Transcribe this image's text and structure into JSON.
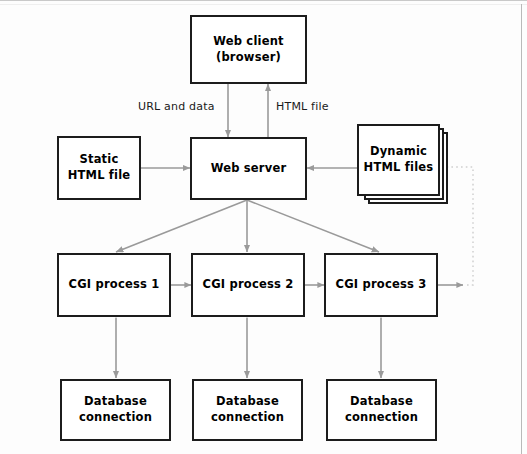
{
  "diagram": {
    "colors": {
      "node_border": "#1c1c1c",
      "node_fill": "#ffffff",
      "arrow": "#9a9a9a",
      "dotted_arrow": "#cfcfcf",
      "text": "#000000",
      "frame": "#c9c9c9"
    },
    "nodes": [
      {
        "id": "web-client",
        "line1": "Web client",
        "line2": "(browser)"
      },
      {
        "id": "static-html",
        "line1": "Static",
        "line2": "HTML file"
      },
      {
        "id": "web-server",
        "line1": "Web server",
        "line2": ""
      },
      {
        "id": "dynamic-html",
        "line1": "Dynamic",
        "line2": "HTML files"
      },
      {
        "id": "cgi-1",
        "line1": "CGI process 1",
        "line2": ""
      },
      {
        "id": "cgi-2",
        "line1": "CGI process 2",
        "line2": ""
      },
      {
        "id": "cgi-3",
        "line1": "CGI process 3",
        "line2": ""
      },
      {
        "id": "db-1",
        "line1": "Database",
        "line2": "connection"
      },
      {
        "id": "db-2",
        "line1": "Database",
        "line2": "connection"
      },
      {
        "id": "db-3",
        "line1": "Database",
        "line2": "connection"
      }
    ],
    "edge_labels": [
      {
        "id": "url-and-data",
        "text": "URL and data"
      },
      {
        "id": "html-file",
        "text": "HTML file"
      }
    ],
    "edges": [
      {
        "from": "web-client",
        "to": "web-server",
        "label": "URL and data",
        "style": "solid",
        "heads": 1
      },
      {
        "from": "web-server",
        "to": "web-client",
        "label": "HTML file",
        "style": "solid",
        "heads": 1
      },
      {
        "from": "static-html",
        "to": "web-server",
        "label": "",
        "style": "solid",
        "heads": 1
      },
      {
        "from": "dynamic-html",
        "to": "web-server",
        "label": "",
        "style": "solid",
        "heads": 1
      },
      {
        "from": "web-server",
        "to": "cgi-1",
        "label": "",
        "style": "solid",
        "heads": 1
      },
      {
        "from": "web-server",
        "to": "cgi-2",
        "label": "",
        "style": "solid",
        "heads": 1
      },
      {
        "from": "web-server",
        "to": "cgi-3",
        "label": "",
        "style": "solid",
        "heads": 1
      },
      {
        "from": "cgi-1",
        "to": "cgi-2",
        "label": "",
        "style": "solid",
        "heads": 1
      },
      {
        "from": "cgi-2",
        "to": "cgi-3",
        "label": "",
        "style": "solid",
        "heads": 1
      },
      {
        "from": "cgi-3",
        "to": "dynamic-html",
        "label": "",
        "style": "dotted",
        "heads": 1
      },
      {
        "from": "cgi-1",
        "to": "db-1",
        "label": "",
        "style": "solid",
        "heads": 2
      },
      {
        "from": "cgi-2",
        "to": "db-2",
        "label": "",
        "style": "solid",
        "heads": 2
      },
      {
        "from": "cgi-3",
        "to": "db-3",
        "label": "",
        "style": "solid",
        "heads": 2
      }
    ]
  }
}
